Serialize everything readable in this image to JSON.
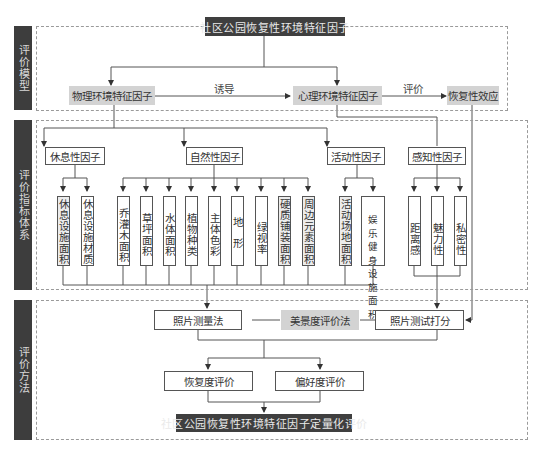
{
  "diagram": {
    "top_title": "社区公园恢复性环境特征因子",
    "bottom_title": "社区公园恢复性环境特征因子定量化评价",
    "colors": {
      "dark_box": "#3f3f3f",
      "gray_box": "#d3d3d3",
      "line": "#555555",
      "dotted_border": "#9a9a9a"
    },
    "sections": [
      {
        "label": "评价模型"
      },
      {
        "label": "评价指标体系"
      },
      {
        "label": "评价方法"
      }
    ],
    "model": {
      "physical": "物理环境特征因子",
      "induce_label": "诱导",
      "psychological": "心理环境特征因子",
      "evaluate_label": "评价",
      "restorative_effect": "恢复性效应"
    },
    "factors": [
      {
        "name": "休息性因子",
        "indicators": [
          {
            "label": "休息设施面积",
            "shaded": true
          },
          {
            "label": "休息设施材质",
            "shaded": false
          }
        ]
      },
      {
        "name": "自然性因子",
        "indicators": [
          {
            "label": "乔灌木面积",
            "shaded": false
          },
          {
            "label": "草坪面积",
            "shaded": false
          },
          {
            "label": "水体面积",
            "shaded": false
          },
          {
            "label": "植物种类",
            "shaded": false
          },
          {
            "label": "主体色彩",
            "shaded": false
          },
          {
            "label": "地形",
            "shaded": false
          },
          {
            "label": "绿视率",
            "shaded": false
          },
          {
            "label": "硬质铺装面积",
            "shaded": true
          },
          {
            "label": "周边元素面积",
            "shaded": true
          }
        ]
      },
      {
        "name": "活动性因子",
        "indicators": [
          {
            "label": "活动场地面积",
            "shaded": true
          },
          {
            "label": "娱乐健身设施面积",
            "shaded": false,
            "rows": [
              "娱乐",
              "健身",
              "设施",
              "面积"
            ]
          }
        ]
      },
      {
        "name": "感知性因子",
        "indicators": [
          {
            "label": "距离感",
            "shaded": false
          },
          {
            "label": "魅力性",
            "shaded": false
          },
          {
            "label": "私密性",
            "shaded": false
          }
        ]
      }
    ],
    "methods": {
      "photo_measure": "照片测量法",
      "scenic_beauty": "美景度评价法",
      "photo_score": "照片测试打分",
      "restoration_eval": "恢复度评价",
      "preference_eval": "偏好度评价"
    }
  }
}
